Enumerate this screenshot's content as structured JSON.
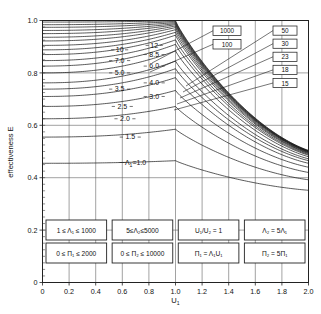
{
  "chart_data": {
    "type": "line",
    "title": "",
    "xlabel": "U1",
    "xlabel_display": "U₁",
    "ylabel": "effectiveness  E",
    "xlim": [
      0,
      2.0
    ],
    "ylim": [
      0,
      1.0
    ],
    "xticks": [
      "0",
      "0.2",
      "0.4",
      "0.6",
      "0.8",
      "1.0",
      "1.2",
      "1.4",
      "1.6",
      "1.8",
      "2.0"
    ],
    "yticks": [
      "0",
      "0.2",
      "0.4",
      "0.6",
      "0.8",
      "1.0"
    ],
    "xtick_step": 0.2,
    "ytick_step": 0.2,
    "grid": "major x and y gridlines shown",
    "minor_ticks": "y-axis minor ticks between 0.8 and 1.0",
    "legend_position": "inline curve labels on left, boxed callouts top-right",
    "series": [
      {
        "name": "1.0",
        "label": "Λ₁=1.0",
        "label_x": 0.72,
        "y0": 0.455,
        "ypeak": 0.465,
        "y_end": 0.352
      },
      {
        "name": "1.5",
        "label": "1.5",
        "label_x": 0.66,
        "y0": 0.555,
        "ypeak": 0.585,
        "y_end": 0.392
      },
      {
        "name": "2.0",
        "label": "2.0",
        "label_x": 0.62,
        "y0": 0.625,
        "ypeak": 0.672,
        "y_end": 0.42
      },
      {
        "name": "2.5",
        "label": "2.5",
        "label_x": 0.6,
        "y0": 0.672,
        "ypeak": 0.733,
        "y_end": 0.44
      },
      {
        "name": "3.0",
        "label": "3.0",
        "label_x": 0.84,
        "y0": 0.71,
        "ypeak": 0.782,
        "y_end": 0.455
      },
      {
        "name": "3.5",
        "label": "3.5",
        "label_x": 0.58,
        "y0": 0.738,
        "ypeak": 0.816,
        "y_end": 0.465
      },
      {
        "name": "4.0",
        "label": "4.0",
        "label_x": 0.84,
        "y0": 0.762,
        "ypeak": 0.845,
        "y_end": 0.472
      },
      {
        "name": "5.0",
        "label": "5.0",
        "label_x": 0.58,
        "y0": 0.8,
        "ypeak": 0.884,
        "y_end": 0.48
      },
      {
        "name": "6.0",
        "label": "6.0",
        "label_x": 0.84,
        "y0": 0.826,
        "ypeak": 0.909,
        "y_end": 0.486
      },
      {
        "name": "7.0",
        "label": "7.0",
        "label_x": 0.58,
        "y0": 0.847,
        "ypeak": 0.926,
        "y_end": 0.489
      },
      {
        "name": "8.5",
        "label": "8.5",
        "label_x": 0.84,
        "y0": 0.87,
        "ypeak": 0.944,
        "y_end": 0.492
      },
      {
        "name": "10",
        "label": "10",
        "label_x": 0.58,
        "y0": 0.888,
        "ypeak": 0.955,
        "y_end": 0.494
      },
      {
        "name": "12",
        "label": "12",
        "label_x": 0.84,
        "y0": 0.905,
        "ypeak": 0.965,
        "y_end": 0.496
      },
      {
        "name": "15",
        "label": "15",
        "boxed": true,
        "y0": 0.922,
        "ypeak": 0.973,
        "y_end": 0.498
      },
      {
        "name": "18",
        "label": "18",
        "boxed": true,
        "y0": 0.936,
        "ypeak": 0.979,
        "y_end": 0.499
      },
      {
        "name": "23",
        "label": "23",
        "boxed": true,
        "y0": 0.95,
        "ypeak": 0.984,
        "y_end": 0.5
      },
      {
        "name": "30",
        "label": "30",
        "boxed": true,
        "y0": 0.962,
        "ypeak": 0.988,
        "y_end": 0.501
      },
      {
        "name": "50",
        "label": "50",
        "boxed": true,
        "y0": 0.974,
        "ypeak": 0.992,
        "y_end": 0.502
      },
      {
        "name": "100",
        "label": "100",
        "boxed": true,
        "y0": 0.984,
        "ypeak": 0.996,
        "y_end": 0.503
      },
      {
        "name": "1000",
        "label": "1000",
        "boxed": true,
        "y0": 0.994,
        "ypeak": 0.999,
        "y_end": 0.504
      }
    ],
    "inline_labels_left": [
      "10",
      "7.0",
      "5.0",
      "3.5",
      "2.5",
      "2.0",
      "1.5",
      "Λ₁=1.0"
    ],
    "inline_labels_right": [
      "12",
      "8.5",
      "6.0",
      "4.0",
      "3.0"
    ],
    "boxed_labels_group_a": [
      "1000",
      "100"
    ],
    "boxed_labels_group_b": [
      "50",
      "30",
      "23",
      "18",
      "15"
    ],
    "annotations": [
      {
        "text": "1 ≤ Λ₁ ≤ 1000"
      },
      {
        "text": "5≤Λ₂≤5000"
      },
      {
        "text": "U₁/U₂ = 1"
      },
      {
        "text": "Λ₂ = 5Λ₁"
      },
      {
        "text": "0 ≤ Π₁ ≤ 2000"
      },
      {
        "text": "0 ≤ Π₂ ≤ 10000"
      },
      {
        "text": "Π₁ = Λ₁U₁"
      },
      {
        "text": "Π₂ = 5Π₁"
      }
    ]
  },
  "axes": {
    "ylabel": "effectiveness  E",
    "xlabel": "U",
    "xlabel_sub": "1",
    "xticks": [
      "0",
      "0.2",
      "0.4",
      "0.6",
      "0.8",
      "1.0",
      "1.2",
      "1.4",
      "1.6",
      "1.8",
      "2.0"
    ],
    "yticks": [
      "1.0",
      "0.8",
      "0.6",
      "0.4",
      "0.2",
      "0"
    ]
  },
  "curve_labels": {
    "left": [
      {
        "text": "10",
        "x": 0.58,
        "e": 0.888
      },
      {
        "text": "7.0",
        "x": 0.58,
        "e": 0.847
      },
      {
        "text": "5.0",
        "x": 0.58,
        "e": 0.8
      },
      {
        "text": "3.5",
        "x": 0.58,
        "e": 0.738
      },
      {
        "text": "2.5",
        "x": 0.6,
        "e": 0.672
      },
      {
        "text": "2.0",
        "x": 0.62,
        "e": 0.625
      },
      {
        "text": "1.5",
        "x": 0.66,
        "e": 0.555
      }
    ],
    "right": [
      {
        "text": "12",
        "x": 0.84,
        "e": 0.905
      },
      {
        "text": "8.5",
        "x": 0.84,
        "e": 0.87
      },
      {
        "text": "6.0",
        "x": 0.84,
        "e": 0.826
      },
      {
        "text": "4.0",
        "x": 0.84,
        "e": 0.762
      },
      {
        "text": "3.0",
        "x": 0.84,
        "e": 0.71
      }
    ],
    "lambda_one": {
      "prefix": "Λ",
      "sub": "1",
      "value": "=1.0",
      "x": 0.7,
      "e": 0.458
    }
  },
  "callouts": {
    "group_a": [
      {
        "text": "1000"
      },
      {
        "text": "100"
      }
    ],
    "group_b": [
      {
        "text": "50"
      },
      {
        "text": "30"
      },
      {
        "text": "23"
      },
      {
        "text": "18"
      },
      {
        "text": "15"
      }
    ]
  },
  "condition_boxes": {
    "row1": [
      {
        "id": "lambda1-range",
        "text": "1 ≤ Λ₁ ≤ 1000"
      },
      {
        "id": "lambda2-range",
        "text": "5≤Λ₂≤5000"
      },
      {
        "id": "u-ratio",
        "text": "U₁/U₂ = 1"
      },
      {
        "id": "lambda2-rel",
        "text": "Λ₂ = 5Λ₁"
      }
    ],
    "row2": [
      {
        "id": "pi1-range",
        "text": "0 ≤ Π₁ ≤ 2000"
      },
      {
        "id": "pi2-range",
        "text": "0 ≤ Π₂ ≤ 10000"
      },
      {
        "id": "pi1-rel",
        "text": "Π₁ = Λ₁U₁"
      },
      {
        "id": "pi2-rel",
        "text": "Π₂ = 5Π₁"
      }
    ]
  },
  "style": {
    "line_color": "#1a1a1a",
    "grid_color": "#555555",
    "frame_color": "#222222",
    "background": "#ffffff"
  }
}
